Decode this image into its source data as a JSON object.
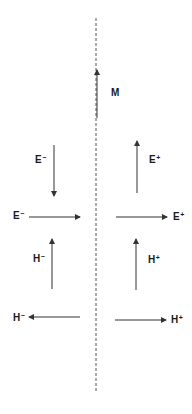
{
  "diagram": {
    "stroke_color": "#333333",
    "axis": {
      "style": "dashed",
      "x": 96,
      "y1": 18,
      "y2": 391
    },
    "vectors": [
      {
        "id": "M",
        "symbol": "M",
        "sign": "",
        "direction": "up",
        "from": [
          97,
          118
        ],
        "to": [
          97,
          70
        ],
        "label_pos": [
          111,
          88
        ]
      },
      {
        "id": "E-minus-vertical",
        "symbol": "E",
        "sign": "−",
        "direction": "down",
        "from": [
          54,
          145
        ],
        "to": [
          54,
          196
        ],
        "label_pos": [
          35,
          155
        ]
      },
      {
        "id": "E-minus-horizontal",
        "symbol": "E",
        "sign": "−",
        "direction": "right",
        "from": [
          29,
          217
        ],
        "to": [
          80,
          217
        ],
        "label_pos": [
          13,
          211
        ]
      },
      {
        "id": "E-plus-vertical",
        "symbol": "E",
        "sign": "+",
        "direction": "up",
        "from": [
          137,
          193
        ],
        "to": [
          137,
          141
        ],
        "label_pos": [
          149,
          155
        ]
      },
      {
        "id": "E-plus-horizontal",
        "symbol": "E",
        "sign": "+",
        "direction": "right",
        "from": [
          116,
          217
        ],
        "to": [
          167,
          217
        ],
        "label_pos": [
          173,
          212
        ]
      },
      {
        "id": "H-minus-vertical",
        "symbol": "H",
        "sign": "−",
        "direction": "up",
        "from": [
          52,
          289
        ],
        "to": [
          52,
          239
        ],
        "label_pos": [
          33,
          254
        ]
      },
      {
        "id": "H-minus-horizontal",
        "symbol": "H",
        "sign": "−",
        "direction": "left",
        "from": [
          80,
          317
        ],
        "to": [
          29,
          317
        ],
        "label_pos": [
          13,
          313
        ]
      },
      {
        "id": "H-plus-vertical",
        "symbol": "H",
        "sign": "+",
        "direction": "up",
        "from": [
          136,
          290
        ],
        "to": [
          136,
          239
        ],
        "label_pos": [
          148,
          255
        ]
      },
      {
        "id": "H-plus-horizontal",
        "symbol": "H",
        "sign": "+",
        "direction": "right",
        "from": [
          115,
          320
        ],
        "to": [
          166,
          320
        ],
        "label_pos": [
          171,
          315
        ]
      }
    ]
  }
}
